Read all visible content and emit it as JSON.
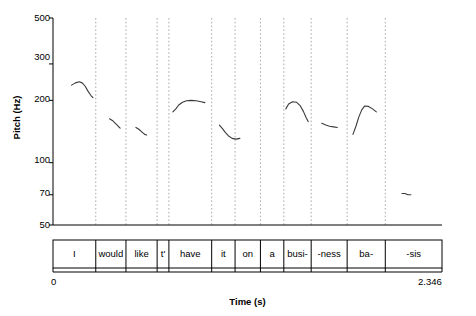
{
  "chart_data": {
    "type": "line",
    "title": "",
    "subtitle": "",
    "xlabel": "Time (s)",
    "ylabel": "Pitch (Hz)",
    "xlim": [
      0,
      2.346
    ],
    "ylim": [
      50,
      500
    ],
    "yscale": "log",
    "xtick_labels": [
      "0",
      "2.346"
    ],
    "ytick_labels": [
      "500",
      "300",
      "200",
      "100",
      "70",
      "50"
    ],
    "ytick_values": [
      500,
      300,
      200,
      100,
      70,
      50
    ],
    "grid": "vertical dotted gridlines at word boundaries",
    "legend": "none",
    "annotations": "utterance segmented into word/syllable tier below time axis",
    "segments": [
      {
        "label": "I",
        "t_start": 0.0,
        "t_end": 0.258
      },
      {
        "label": "would",
        "t_start": 0.258,
        "t_end": 0.44
      },
      {
        "label": "like",
        "t_start": 0.44,
        "t_end": 0.628
      },
      {
        "label": "t'",
        "t_start": 0.628,
        "t_end": 0.699
      },
      {
        "label": "have",
        "t_start": 0.699,
        "t_end": 0.957
      },
      {
        "label": "it",
        "t_start": 0.957,
        "t_end": 1.098
      },
      {
        "label": "on",
        "t_start": 1.098,
        "t_end": 1.251
      },
      {
        "label": "a",
        "t_start": 1.251,
        "t_end": 1.392
      },
      {
        "label": "busi-",
        "t_start": 1.392,
        "t_end": 1.557
      },
      {
        "label": "-ness",
        "t_start": 1.557,
        "t_end": 1.774
      },
      {
        "label": "ba-",
        "t_start": 1.774,
        "t_end": 2.004
      },
      {
        "label": "-sis",
        "t_start": 2.004,
        "t_end": 2.346
      }
    ],
    "series": [
      {
        "name": "I",
        "points": [
          {
            "t": 0.112,
            "hz": 237
          },
          {
            "t": 0.135,
            "hz": 243
          },
          {
            "t": 0.158,
            "hz": 246
          },
          {
            "t": 0.176,
            "hz": 243
          },
          {
            "t": 0.194,
            "hz": 234
          },
          {
            "t": 0.212,
            "hz": 221
          },
          {
            "t": 0.229,
            "hz": 211
          },
          {
            "t": 0.241,
            "hz": 206
          }
        ]
      },
      {
        "name": "would",
        "points": [
          {
            "t": 0.341,
            "hz": 163
          },
          {
            "t": 0.358,
            "hz": 160
          },
          {
            "t": 0.376,
            "hz": 155
          },
          {
            "t": 0.393,
            "hz": 150
          },
          {
            "t": 0.405,
            "hz": 147
          }
        ]
      },
      {
        "name": "like",
        "points": [
          {
            "t": 0.5,
            "hz": 148
          },
          {
            "t": 0.518,
            "hz": 145
          },
          {
            "t": 0.535,
            "hz": 141
          },
          {
            "t": 0.553,
            "hz": 137
          },
          {
            "t": 0.565,
            "hz": 136
          }
        ]
      },
      {
        "name": "have",
        "points": [
          {
            "t": 0.723,
            "hz": 176
          },
          {
            "t": 0.741,
            "hz": 182
          },
          {
            "t": 0.758,
            "hz": 190
          },
          {
            "t": 0.781,
            "hz": 196
          },
          {
            "t": 0.805,
            "hz": 199
          },
          {
            "t": 0.834,
            "hz": 200
          },
          {
            "t": 0.863,
            "hz": 199
          },
          {
            "t": 0.893,
            "hz": 197
          },
          {
            "t": 0.916,
            "hz": 195
          }
        ]
      },
      {
        "name": "it",
        "points": [
          {
            "t": 1.004,
            "hz": 152
          },
          {
            "t": 1.022,
            "hz": 146
          },
          {
            "t": 1.039,
            "hz": 140
          },
          {
            "t": 1.057,
            "hz": 135
          },
          {
            "t": 1.08,
            "hz": 131
          },
          {
            "t": 1.104,
            "hz": 130
          },
          {
            "t": 1.127,
            "hz": 131
          }
        ]
      },
      {
        "name": "busi-",
        "points": [
          {
            "t": 1.404,
            "hz": 182
          },
          {
            "t": 1.421,
            "hz": 192
          },
          {
            "t": 1.445,
            "hz": 197
          },
          {
            "t": 1.468,
            "hz": 196
          },
          {
            "t": 1.492,
            "hz": 188
          },
          {
            "t": 1.51,
            "hz": 177
          },
          {
            "t": 1.527,
            "hz": 165
          },
          {
            "t": 1.539,
            "hz": 158
          }
        ]
      },
      {
        "name": "-ness",
        "points": [
          {
            "t": 1.621,
            "hz": 155
          },
          {
            "t": 1.645,
            "hz": 152
          },
          {
            "t": 1.668,
            "hz": 150
          },
          {
            "t": 1.692,
            "hz": 149
          },
          {
            "t": 1.715,
            "hz": 148
          }
        ]
      },
      {
        "name": "ba-",
        "points": [
          {
            "t": 1.809,
            "hz": 137
          },
          {
            "t": 1.827,
            "hz": 150
          },
          {
            "t": 1.844,
            "hz": 166
          },
          {
            "t": 1.862,
            "hz": 180
          },
          {
            "t": 1.88,
            "hz": 188
          },
          {
            "t": 1.903,
            "hz": 187
          },
          {
            "t": 1.927,
            "hz": 182
          },
          {
            "t": 1.95,
            "hz": 176
          }
        ]
      },
      {
        "name": "-sis",
        "points": [
          {
            "t": 2.105,
            "hz": 71
          },
          {
            "t": 2.123,
            "hz": 71
          },
          {
            "t": 2.14,
            "hz": 70
          },
          {
            "t": 2.158,
            "hz": 70
          }
        ]
      }
    ]
  },
  "axes": {
    "ylabel": "Pitch (Hz)",
    "xlabel": "Time (s)",
    "x_start": "0",
    "x_end": "2.346",
    "yticks": [
      "500",
      "300",
      "200",
      "100",
      "70",
      "50"
    ]
  },
  "colors": {
    "background": "#ffffff",
    "axis": "#000000",
    "contour": "#3a3a3a",
    "gridline": "#aaaaaa",
    "text": "#000000"
  }
}
